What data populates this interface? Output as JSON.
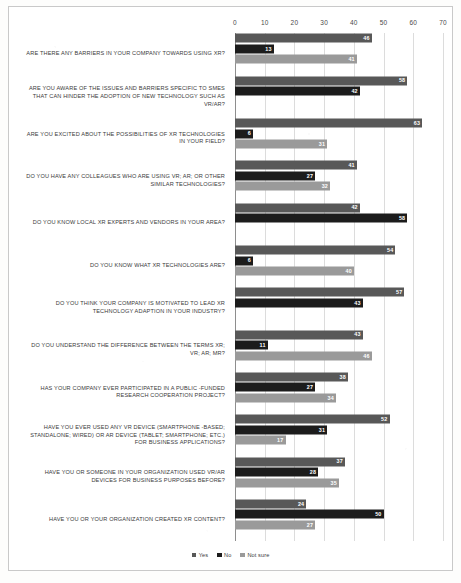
{
  "chart_data": {
    "type": "bar",
    "orientation": "horizontal",
    "title": "",
    "xlabel": "",
    "ylabel": "",
    "xlim": [
      0,
      70
    ],
    "xticks": [
      0,
      10,
      20,
      30,
      40,
      50,
      60,
      70
    ],
    "grid": true,
    "legend_position": "bottom",
    "colors": {
      "yes": "#585858",
      "no": "#1c1c1c",
      "not_sure": "#9a9a9a"
    },
    "legend": [
      {
        "key": "yes",
        "label": "Yes"
      },
      {
        "key": "no",
        "label": "No"
      },
      {
        "key": "not_sure",
        "label": "Not sure"
      }
    ],
    "categories": [
      "ARE THERE ANY BARRIERS IN YOUR COMPANY TOWARDS USING XR?",
      "ARE YOU AWARE OF THE ISSUES AND BARRIERS SPECIFIC TO SMES THAT CAN HINDER THE ADOPTION OF NEW TECHNOLOGY SUCH AS VR/AR?",
      "ARE YOU EXCITED ABOUT THE POSSIBILITIES OF XR TECHNOLOGIES IN YOUR FIELD?",
      "DO YOU HAVE ANY COLLEAGUES WHO ARE USING VR; AR; OR OTHER SIMILAR TECHNOLOGIES?",
      "DO YOU KNOW LOCAL XR EXPERTS AND VENDORS IN YOUR AREA?",
      "DO YOU KNOW WHAT XR TECHNOLOGIES ARE?",
      "DO YOU THINK YOUR COMPANY IS MOTIVATED TO LEAD XR TECHNOLOGY ADAPTION IN YOUR INDUSTRY?",
      "DO YOU UNDERSTAND THE DIFFERENCE BETWEEN THE TERMS XR; VR; AR; MR?",
      "HAS YOUR COMPANY EVER PARTICIPATED IN A PUBLIC -FUNDED RESEARCH COOPERATION PROJECT?",
      "HAVE YOU EVER USED ANY VR DEVICE (SMARTPHONE -BASED; STANDALONE; WIRED) OR AR DEVICE (TABLET; SMARTPHONE; ETC.) FOR BUSINESS APPLICATIONS?",
      "HAVE YOU OR SOMEONE IN YOUR ORGANIZATION USED VR/AR DEVICES FOR BUSINESS PURPOSES BEFORE?",
      "HAVE YOU OR YOUR ORGANIZATION CREATED XR CONTENT?"
    ],
    "series": [
      {
        "name": "Yes",
        "key": "yes",
        "values": [
          46,
          58,
          63,
          41,
          42,
          54,
          57,
          43,
          38,
          52,
          37,
          24
        ]
      },
      {
        "name": "No",
        "key": "no",
        "values": [
          13,
          42,
          6,
          27,
          58,
          6,
          43,
          11,
          27,
          31,
          28,
          50
        ]
      },
      {
        "name": "Not sure",
        "key": "not_sure",
        "values": [
          41,
          null,
          31,
          32,
          null,
          40,
          null,
          46,
          34,
          17,
          35,
          27
        ]
      }
    ]
  }
}
